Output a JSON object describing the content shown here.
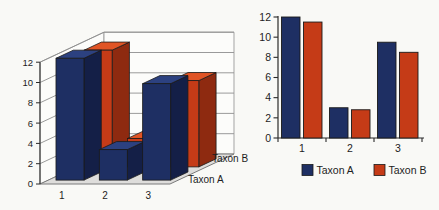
{
  "figure": {
    "background": "#f9f9f6",
    "text_color": "#1d1d1d"
  },
  "colors": {
    "taxon_a_front": "#1e2f63",
    "taxon_a_side": "#141f47",
    "taxon_a_top": "#2c4180",
    "taxon_b_front": "#c53b17",
    "taxon_b_side": "#8e2a10",
    "taxon_b_top": "#e05425",
    "outline": "#1a1a1a",
    "axis": "#2a2a2a",
    "gridline": "#8f8f8f",
    "floor_fill": "#dedddb",
    "floor_edge": "#7a7a7a",
    "wall_fill": "#fcfcfa"
  },
  "chart_data": [
    {
      "id": "left-3d-bar-chart",
      "type": "bar",
      "projection": "3d",
      "categories": [
        "1",
        "2",
        "3"
      ],
      "series": [
        {
          "name": "Taxon A",
          "values": [
            12,
            3,
            9.5
          ],
          "color_key": "taxon_a"
        },
        {
          "name": "Taxon B",
          "values": [
            11.5,
            2.8,
            8.5
          ],
          "color_key": "taxon_b"
        }
      ],
      "yticks": [
        0,
        2,
        4,
        6,
        8,
        10,
        12
      ],
      "ylim": [
        0,
        12
      ],
      "depth_axis_labels": [
        "Taxon A",
        "Taxon B"
      ],
      "grid": true,
      "legend": "none",
      "title": "",
      "xlabel": "",
      "ylabel": ""
    },
    {
      "id": "right-2d-bar-chart",
      "type": "bar",
      "projection": "2d",
      "categories": [
        "1",
        "2",
        "3"
      ],
      "series": [
        {
          "name": "Taxon A",
          "values": [
            12,
            3,
            9.5
          ],
          "color_key": "taxon_a"
        },
        {
          "name": "Taxon B",
          "values": [
            11.5,
            2.8,
            8.5
          ],
          "color_key": "taxon_b"
        }
      ],
      "yticks": [
        0,
        2,
        4,
        6,
        8,
        10,
        12
      ],
      "ylim": [
        0,
        12
      ],
      "grid": false,
      "legend": "bottom",
      "legend_labels": [
        "Taxon A",
        "Taxon B"
      ],
      "title": "",
      "xlabel": "",
      "ylabel": ""
    }
  ]
}
